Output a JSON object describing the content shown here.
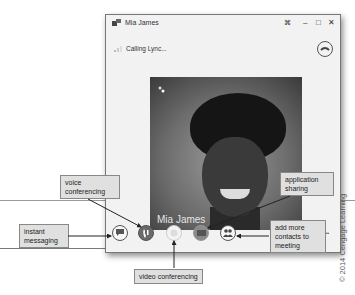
{
  "window": {
    "title": "Mia James",
    "status": "Calling Lync...",
    "buttons": {
      "popout": "⌘",
      "minimize": "–",
      "maximize": "□",
      "close": "✕"
    }
  },
  "video": {
    "name_overlay": "Mia James"
  },
  "controls": [
    {
      "name": "instant-messaging-button",
      "icon": "chat-bubble-icon"
    },
    {
      "name": "voice-conferencing-button",
      "icon": "phone-icon"
    },
    {
      "name": "video-conferencing-button",
      "icon": "video-icon"
    },
    {
      "name": "application-sharing-button",
      "icon": "monitor-icon"
    },
    {
      "name": "add-contacts-button",
      "icon": "people-icon"
    }
  ],
  "callouts": {
    "voice": "voice conferencing",
    "instant": "instant messaging",
    "video": "video conferencing",
    "app": "application sharing",
    "add": "add more contacts to meeting"
  },
  "more_dots": "••",
  "copyright": "© 2014 Cengage Learning",
  "colors": {
    "voice_active": "#6a6a6a",
    "callout_bg": "#e0e0e0"
  }
}
